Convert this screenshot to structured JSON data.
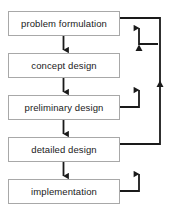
{
  "diagram": {
    "type": "flowchart",
    "colors": {
      "box_border": "#a8a8a8",
      "box_fill": "#ffffff",
      "arrow": "#1a1a1a",
      "text": "#1a1a1a",
      "background": "#ffffff"
    },
    "nodes": [
      {
        "id": "problem-formulation",
        "label": "problem formulation",
        "x": 8,
        "y": 11,
        "w": 112,
        "h": 25
      },
      {
        "id": "concept-design",
        "label": "concept design",
        "x": 8,
        "y": 53,
        "w": 112,
        "h": 25
      },
      {
        "id": "preliminary-design",
        "label": "preliminary design",
        "x": 8,
        "y": 95,
        "w": 112,
        "h": 25
      },
      {
        "id": "detailed-design",
        "label": "detailed design",
        "x": 8,
        "y": 137,
        "w": 112,
        "h": 25
      },
      {
        "id": "implementation",
        "label": "implementation",
        "x": 8,
        "y": 179,
        "w": 112,
        "h": 25
      }
    ],
    "forward_edges": [
      {
        "id": "edge-problem-to-concept",
        "from": "problem formulation",
        "to": "concept design",
        "direction": "down"
      },
      {
        "id": "edge-concept-to-preliminary",
        "from": "concept design",
        "to": "preliminary design",
        "direction": "down"
      },
      {
        "id": "edge-preliminary-to-detailed",
        "from": "preliminary design",
        "to": "detailed design",
        "direction": "down"
      },
      {
        "id": "edge-detailed-to-implementation",
        "from": "detailed design",
        "to": "implementation",
        "direction": "down"
      }
    ],
    "feedback_edges": [
      {
        "id": "edge-problem-to-concept-feedback",
        "from": "problem formulation",
        "to": "concept design",
        "direction": "up",
        "route": "right"
      },
      {
        "id": "edge-preliminary-to-concept-feedback",
        "from": "preliminary design",
        "to": "concept design",
        "direction": "up",
        "route": "right"
      },
      {
        "id": "edge-implementation-to-detailed-feedback",
        "from": "implementation",
        "to": "detailed design",
        "direction": "up",
        "route": "right"
      },
      {
        "id": "edge-detailed-to-problem-feedback",
        "from": "detailed design",
        "to": "problem formulation",
        "direction": "up",
        "route": "far-right"
      }
    ]
  }
}
